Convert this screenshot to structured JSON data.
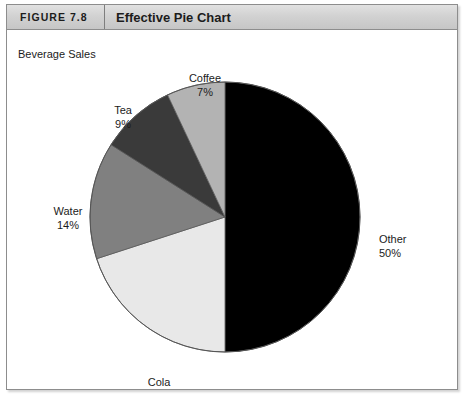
{
  "figure": {
    "number": "FIGURE 7.8",
    "title": "Effective Pie Chart"
  },
  "chart_data": {
    "type": "pie",
    "title": "Beverage Sales",
    "xlabel": "",
    "ylabel": "",
    "legend_position": "none",
    "labels_on_slices": true,
    "start_angle_deg": 0,
    "direction": "clockwise",
    "categories": [
      "Other",
      "Cola",
      "Water",
      "Tea",
      "Coffee"
    ],
    "values": [
      50,
      20,
      14,
      9,
      7
    ],
    "value_unit": "%",
    "slices": [
      {
        "label": "Other",
        "percent": "50%",
        "value": 50,
        "color": "#000000"
      },
      {
        "label": "Cola",
        "percent": "20%",
        "value": 20,
        "color": "#e8e8e8"
      },
      {
        "label": "Water",
        "percent": "14%",
        "value": 14,
        "color": "#808080"
      },
      {
        "label": "Tea",
        "percent": "9%",
        "value": 9,
        "color": "#3a3a3a"
      },
      {
        "label": "Coffee",
        "percent": "7%",
        "value": 7,
        "color": "#b3b3b3"
      }
    ]
  },
  "colors": {
    "frame_border": "#8d8d8d",
    "header_background": "#d2d2d2",
    "text": "#1c1c1c",
    "page_background": "#ffffff"
  }
}
